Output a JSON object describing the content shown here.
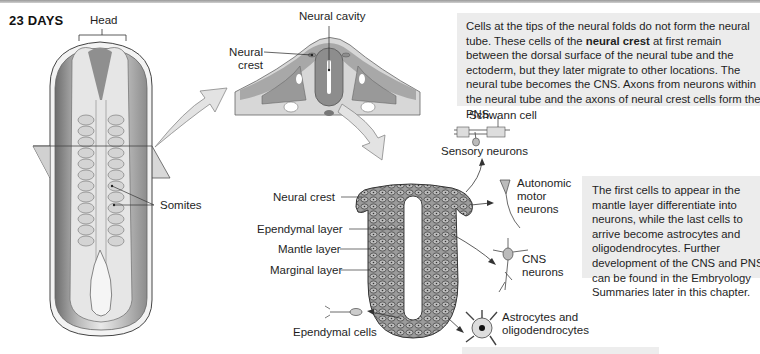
{
  "figure": {
    "title": "23 DAYS",
    "embryo_labels": {
      "head": "Head",
      "somites": "Somites"
    },
    "cross_section_labels": {
      "neural_cavity": "Neural cavity",
      "neural_crest": "Neural crest"
    },
    "neural_tube_labels": {
      "neural_crest": "Neural crest",
      "ependymal_layer": "Ependymal layer",
      "mantle_layer": "Mantle layer",
      "marginal_layer": "Marginal layer",
      "ependymal_cells": "Ependymal cells"
    },
    "cell_type_labels": {
      "schwann_cell": "Schwann cell",
      "sensory_neurons": "Sensory neurons",
      "autonomic_motor_neurons_line1": "Autonomic",
      "autonomic_motor_neurons_line2": "motor",
      "autonomic_motor_neurons_line3": "neurons",
      "cns_neurons_line1": "CNS",
      "cns_neurons_line2": "neurons",
      "astrocytes_line1": "Astrocytes and",
      "astrocytes_line2": "oligodendrocytes"
    },
    "caption_top": {
      "part1": "Cells at the tips of the neural folds do not form the neural tube. These cells of the ",
      "bold": "neural crest",
      "part2": " at first remain between the dorsal surface of the neural tube and the ectoderm, but they later migrate to other locations. The neural tube becomes the CNS. Axons from neurons within the neural tube and the axons of neural crest cells form the PNS."
    },
    "caption_right": "The first cells to appear in the mantle layer differentiate into neurons, while the last cells to arrive become astrocytes and oligodendrocytes. Further development of the CNS and PNS can be found in the Embryology Summaries later in this chapter.",
    "colors": {
      "tissue_dark": "#8a8a8a",
      "tissue_light": "#cfcfcf",
      "background": "#ffffff",
      "caption_bg": "#ececec",
      "arrow_fill": "#e3e3e3"
    }
  }
}
